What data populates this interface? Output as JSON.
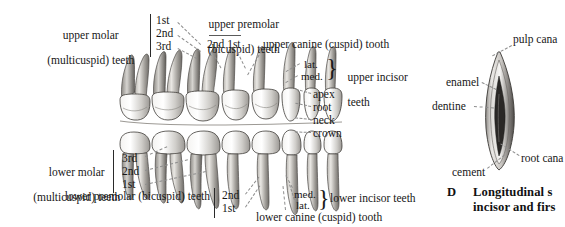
{
  "figure": {
    "id": "D",
    "caption_line1": "Longitudinal s",
    "caption_line2": "incisor and firs",
    "background": "#ffffff",
    "ink": "#171717"
  },
  "labels": {
    "upper_molar_l1": "upper molar",
    "upper_molar_l2": "(multicuspid) teeth",
    "upper_molar_items": [
      "1st",
      "2nd",
      "3rd"
    ],
    "upper_premolar_l1": "upper premolar",
    "upper_premolar_l2": "(bicuspid) teeth",
    "upper_premolar_items": "2nd 1st",
    "upper_canine": "upper canine (cuspid) tooth",
    "upper_incisor_items": [
      "lat.",
      "med."
    ],
    "upper_incisor_l1": "upper incisor",
    "upper_incisor_l2": "teeth",
    "parts": [
      "apex",
      "root",
      "neck",
      "crown"
    ],
    "lower_molar_l1": "lower molar",
    "lower_molar_l2": "(multicuspid) teeth",
    "lower_molar_items": [
      "3rd",
      "2nd",
      "1st"
    ],
    "lower_premolar": "lower premolar (bicuspid) teeth",
    "lower_premolar_items": [
      "2nd",
      "1st"
    ],
    "lower_incisor_items": [
      "med.",
      "lat."
    ],
    "lower_incisor": "lower incisor teeth",
    "lower_canine": "lower canine (cuspid) tooth",
    "enamel": "enamel",
    "dentine": "dentine",
    "pulp_canal": "pulp cana",
    "root_canal": "root cana",
    "cement": "cement"
  }
}
